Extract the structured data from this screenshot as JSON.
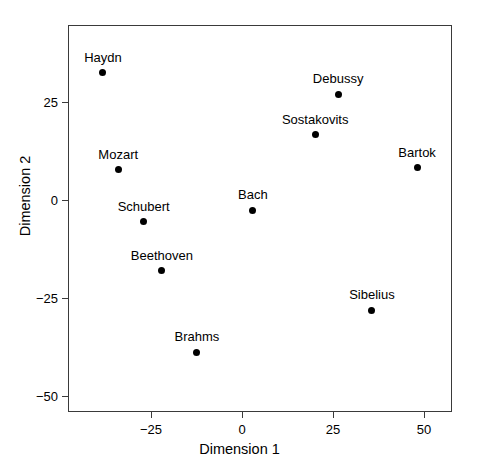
{
  "chart_data": {
    "type": "scatter",
    "title": "",
    "xlabel": "Dimension 1",
    "ylabel": "Dimension 2",
    "xlim": [
      -42,
      52
    ],
    "ylim": [
      -54,
      36
    ],
    "xticks": [
      -25,
      0,
      25,
      50
    ],
    "xticklabels": [
      "−25",
      "0",
      "25",
      "50"
    ],
    "yticks": [
      25,
      0,
      -25,
      -50
    ],
    "yticklabels": [
      "25",
      "0",
      "−25",
      "−50"
    ],
    "grid": false,
    "legend": "none",
    "marker": "filled-circle",
    "marker_color": "#000000",
    "points": [
      {
        "label": "Haydn",
        "x": -38.2,
        "y": 32.4,
        "label_dx": 0,
        "label_dy": -9
      },
      {
        "label": "Mozart",
        "x": -34.0,
        "y": 7.7,
        "label_dx": 0,
        "label_dy": -9
      },
      {
        "label": "Schubert",
        "x": -27.0,
        "y": -5.6,
        "label_dx": 0,
        "label_dy": -9
      },
      {
        "label": "Beethoven",
        "x": -22.0,
        "y": -18.1,
        "label_dx": 0,
        "label_dy": -9
      },
      {
        "label": "Brahms",
        "x": -12.4,
        "y": -38.8,
        "label_dx": 0,
        "label_dy": -9
      },
      {
        "label": "Bach",
        "x": 3.0,
        "y": -2.6,
        "label_dx": 0,
        "label_dy": -9
      },
      {
        "label": "Sostakovits",
        "x": 20.1,
        "y": 16.6,
        "label_dx": 0,
        "label_dy": -9
      },
      {
        "label": "Debussy",
        "x": 26.4,
        "y": 27.0,
        "label_dx": 0,
        "label_dy": -9
      },
      {
        "label": "Sibelius",
        "x": 35.7,
        "y": -28.1,
        "label_dx": 0,
        "label_dy": -9
      },
      {
        "label": "Bartok",
        "x": 48.1,
        "y": 8.2,
        "label_dx": 0,
        "label_dy": -9
      }
    ]
  },
  "geometry": {
    "box_left": 68,
    "box_top": 25,
    "box_right": 452,
    "box_bottom": 412,
    "x_origin_px": 242,
    "x_scale_px_per_unit": 3.64,
    "y_origin_px": 200,
    "y_scale_px_per_unit": 3.92
  }
}
